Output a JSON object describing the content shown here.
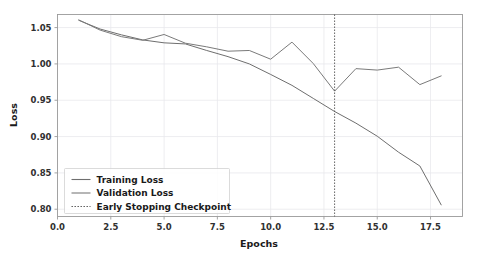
{
  "chart_data": {
    "type": "line",
    "title": "",
    "xlabel": "Epochs",
    "ylabel": "Loss",
    "xlim": [
      0.0,
      19.0
    ],
    "ylim": [
      0.79,
      1.068
    ],
    "grid": true,
    "legend_position": "lower left",
    "xticks": [
      "0.0",
      "2.5",
      "5.0",
      "7.5",
      "10.0",
      "12.5",
      "15.0",
      "17.5"
    ],
    "xtick_values": [
      0.0,
      2.5,
      5.0,
      7.5,
      10.0,
      12.5,
      15.0,
      17.5
    ],
    "yticks": [
      "0.80",
      "0.85",
      "0.90",
      "0.95",
      "1.00",
      "1.05"
    ],
    "ytick_values": [
      0.8,
      0.85,
      0.9,
      0.95,
      1.0,
      1.05
    ],
    "x": [
      1,
      2,
      3,
      4,
      5,
      6,
      7,
      8,
      9,
      10,
      11,
      12,
      13,
      14,
      15,
      16,
      17,
      18
    ],
    "series": [
      {
        "name": "Training Loss",
        "color": "#6e6e6e",
        "style": "solid",
        "values": [
          1.06,
          1.048,
          1.04,
          1.033,
          1.029,
          1.0275,
          1.0185,
          1.01,
          1.0,
          0.9855,
          0.9705,
          0.9525,
          0.9345,
          0.9185,
          0.9005,
          0.8785,
          0.8595,
          0.806
        ]
      },
      {
        "name": "Validation Loss",
        "color": "#7a7a7a",
        "style": "solid",
        "values": [
          1.0605,
          1.0465,
          1.0375,
          1.0325,
          1.0405,
          1.0285,
          1.0235,
          1.0175,
          1.0185,
          1.0065,
          1.03,
          1.0005,
          0.9625,
          0.9935,
          0.9915,
          0.9955,
          0.9715,
          0.9835
        ]
      }
    ],
    "annotations": [
      {
        "name": "Early Stopping Checkpoint",
        "type": "vline",
        "x": 13,
        "color": "#555555",
        "style": "dotted"
      }
    ],
    "legend": [
      {
        "label": "Training Loss",
        "color": "#6e6e6e",
        "style": "solid"
      },
      {
        "label": "Validation Loss",
        "color": "#7a7a7a",
        "style": "solid"
      },
      {
        "label": "Early Stopping Checkpoint",
        "color": "#555555",
        "style": "dotted"
      }
    ]
  }
}
